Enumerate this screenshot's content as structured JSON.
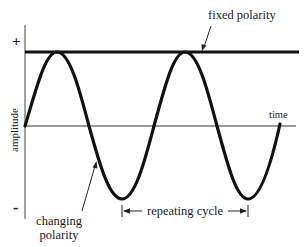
{
  "diagram": {
    "type": "sine-wave-polarity",
    "labels": {
      "fixed_polarity": "fixed polarity",
      "changing_polarity_line1": "changing",
      "changing_polarity_line2": "polarity",
      "repeating_cycle": "repeating cycle",
      "time_axis": "time",
      "amplitude_axis": "amplitude",
      "plus": "+",
      "minus": "-"
    },
    "colors": {
      "ink": "#1a1a1a",
      "axis": "#333333",
      "background": "#ffffff"
    },
    "geometry": {
      "baseline_y": 126,
      "amplitude_px": 73,
      "period_px": 127,
      "start_x": 25,
      "end_x": 280,
      "fixed_line_y": 52,
      "peaks_x": [
        57,
        185
      ],
      "troughs_x": [
        122,
        248
      ]
    }
  }
}
